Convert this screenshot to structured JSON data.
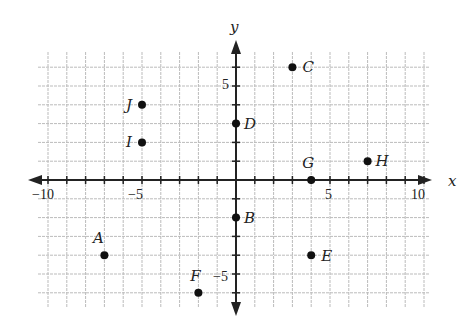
{
  "chart_data": {
    "type": "scatter",
    "title": "",
    "xlabel": "x",
    "ylabel": "y",
    "xlim": [
      -10.5,
      10.5
    ],
    "ylim": [
      -6.5,
      7
    ],
    "grid": true,
    "x_tick_labels": [
      "-10",
      "-5",
      "5",
      "10"
    ],
    "y_tick_labels": [
      "5",
      "-5"
    ],
    "points": [
      {
        "label": "A",
        "x": -7,
        "y": -4
      },
      {
        "label": "B",
        "x": 0,
        "y": -2
      },
      {
        "label": "C",
        "x": 3,
        "y": 6
      },
      {
        "label": "D",
        "x": 0,
        "y": 3
      },
      {
        "label": "E",
        "x": 4,
        "y": -4
      },
      {
        "label": "F",
        "x": -2,
        "y": -6
      },
      {
        "label": "G",
        "x": 4,
        "y": 0
      },
      {
        "label": "H",
        "x": 7,
        "y": 1
      },
      {
        "label": "I",
        "x": -5,
        "y": 2
      },
      {
        "label": "J",
        "x": -5,
        "y": 4
      }
    ]
  },
  "axes": {
    "x_label": "x",
    "y_label": "y",
    "x_neg10": "−10",
    "x_neg5": "−5",
    "x_5": "5",
    "x_10": "10",
    "y_5": "5",
    "y_neg5": "−5"
  },
  "colors": {
    "grid": "#bbbbbb",
    "axis": "#222222",
    "point": "#111111"
  }
}
